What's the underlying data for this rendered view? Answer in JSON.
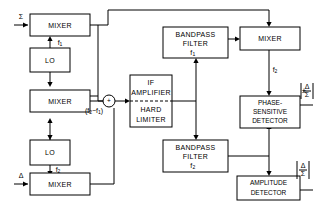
{
  "diagram": {
    "colors": {
      "line": "#000000",
      "box_fill": "#ffffff",
      "background": "#ffffff"
    },
    "inputs": [
      {
        "name": "sum-input",
        "label": "Σ"
      },
      {
        "name": "delta-input",
        "label": "Δ"
      }
    ],
    "blocks": [
      {
        "id": "mixer_sum",
        "label": "MIXER"
      },
      {
        "id": "lo_1",
        "label": "LO"
      },
      {
        "id": "mixer_mid",
        "label": "MIXER"
      },
      {
        "id": "lo_2",
        "label": "LO"
      },
      {
        "id": "mixer_delta",
        "label": "MIXER"
      },
      {
        "id": "if_amp",
        "label_top": "IF",
        "label_top2": "AMPLIFIER",
        "label_bot": "HARD",
        "label_bot2": "LIMITER"
      },
      {
        "id": "bpf_1",
        "label_top": "BANDPASS",
        "label_bot": "FILTER",
        "sub": "f",
        "subidx": "1"
      },
      {
        "id": "bpf_2",
        "label_top": "BANDPASS",
        "label_bot": "FILTER",
        "sub": "f",
        "subidx": "2"
      },
      {
        "id": "mixer_out",
        "label": "MIXER"
      },
      {
        "id": "psd",
        "label_1": "PHASE-",
        "label_2": "SENSITIVE",
        "label_3": "DETECTOR"
      },
      {
        "id": "amp_det",
        "label_1": "AMPLITUDE",
        "label_2": "DETECTOR"
      }
    ],
    "signal_labels": [
      {
        "id": "f1_lo",
        "base": "f",
        "index": "1"
      },
      {
        "id": "f2_lo",
        "base": "f",
        "index": "2"
      },
      {
        "id": "f2_mix",
        "base": "f",
        "index": "2"
      },
      {
        "id": "if_diff",
        "text_open": "(f",
        "i1": "2",
        "text_mid": "−f",
        "i2": "1",
        "text_close": ")"
      }
    ],
    "outputs": [
      {
        "id": "psd_out",
        "sign": "±",
        "numerator": "Δ",
        "denominator": "Σ"
      },
      {
        "id": "amp_out",
        "sign": "",
        "numerator": "Δ",
        "denominator": "Σ"
      }
    ],
    "junction": {
      "id": "summing-junction",
      "symbol": "+"
    }
  }
}
